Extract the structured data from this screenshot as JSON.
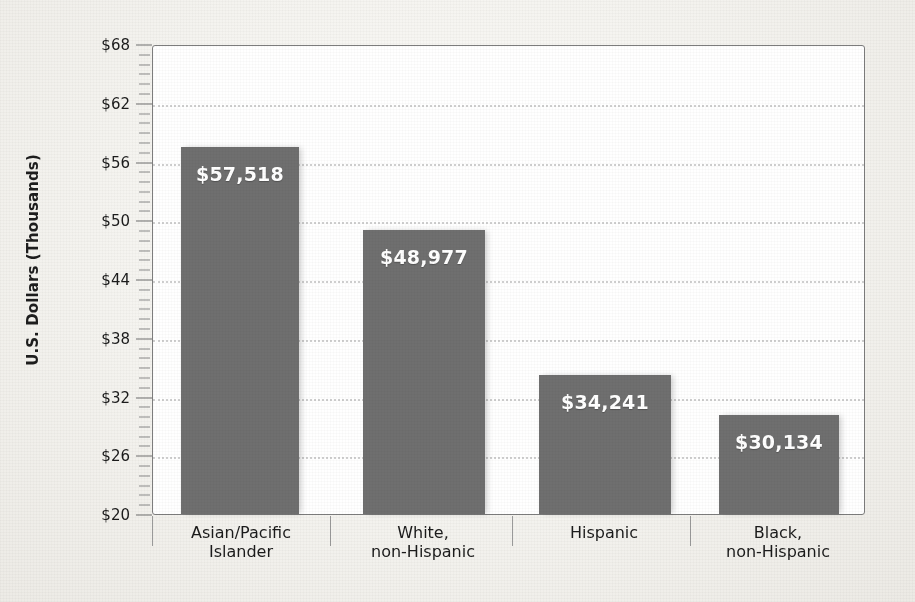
{
  "chart_data": {
    "type": "bar",
    "title": "",
    "subtitle": "",
    "xlabel": "",
    "ylabel": "U.S. Dollars (Thousands)",
    "categories": [
      "Asian/Pacific\nIslander",
      "White,\nnon-Hispanic",
      "Hispanic",
      "Black,\nnon-Hispanic"
    ],
    "category_lines": [
      [
        "Asian/Pacific",
        "Islander"
      ],
      [
        "White,",
        "non-Hispanic"
      ],
      [
        "Hispanic"
      ],
      [
        "Black,",
        "non-Hispanic"
      ]
    ],
    "values": [
      57518,
      48977,
      34241,
      30134
    ],
    "value_labels": [
      "$57,518",
      "$48,977",
      "$34,241",
      "$30,134"
    ],
    "values_thousands": [
      57.518,
      48.977,
      34.241,
      30.134
    ],
    "ylim": [
      20,
      68
    ],
    "ytick_values": [
      68,
      62,
      56,
      50,
      44,
      38,
      32,
      26,
      20
    ],
    "ytick_labels": [
      "$68",
      "$62",
      "$56",
      "$50",
      "$44",
      "$38",
      "$32",
      "$26",
      "$20"
    ],
    "ytick_step": 6,
    "minor_tick_step": 1,
    "grid": true,
    "gridlines_at": [
      62,
      56,
      50,
      44,
      38,
      32,
      26
    ],
    "legend": "none",
    "legend_position": "none",
    "bar_color": "#6f6f6f",
    "value_label_color": "#ffffff",
    "grid_color": "#cfcfcf",
    "axis_color": "#7d7d7d",
    "text_color": "#1b1b1b",
    "background_color": "#f4f3ef",
    "plot_background_color": "#ffffff"
  },
  "axis": {
    "y_title": "U.S. Dollars (Thousands)"
  }
}
